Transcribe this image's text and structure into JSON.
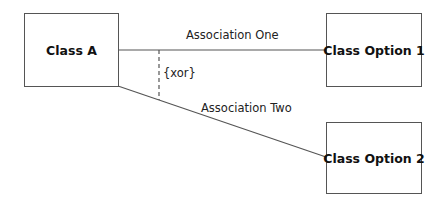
{
  "diagram": {
    "type": "UML class diagram",
    "classes": [
      {
        "id": "class-a",
        "name": "Class A"
      },
      {
        "id": "class-option-1",
        "name": "Class Option 1"
      },
      {
        "id": "class-option-2",
        "name": "Class Option 2"
      }
    ],
    "associations": [
      {
        "label": "Association One",
        "from": "class-a",
        "to": "class-option-1"
      },
      {
        "label": "Association Two",
        "from": "class-a",
        "to": "class-option-2"
      }
    ],
    "constraint": {
      "label": "{xor}",
      "between": [
        "Association One",
        "Association Two"
      ]
    },
    "colors": {
      "line": "#555555",
      "text": "#111111",
      "background": "#ffffff"
    }
  }
}
